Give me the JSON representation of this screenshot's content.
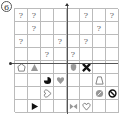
{
  "problem_label": "6",
  "grid": {
    "rows": 8,
    "cols": 8,
    "cells": [
      [
        "?",
        "?",
        "",
        "",
        "",
        "?",
        "",
        "?"
      ],
      [
        "",
        "?",
        "",
        "",
        "",
        "",
        "?",
        ""
      ],
      [
        "?",
        "",
        "",
        "?",
        "",
        "?",
        "",
        ""
      ],
      [
        "",
        "",
        "?",
        "",
        "?",
        "",
        "",
        ""
      ],
      [
        "pentagon-outline",
        "triangle-gray",
        "",
        "",
        "shield-gray",
        "x-black",
        "",
        ""
      ],
      [
        "",
        "",
        "pacman-black",
        "heart-gray",
        "",
        "",
        "trapezoid-outline",
        ""
      ],
      [
        "",
        "",
        "heart-sideways-outline",
        "",
        "",
        "",
        "circle-slash-gray",
        "no-symbol-black"
      ],
      [
        "",
        "triangle-right-black",
        "",
        "",
        "bowtie-gray",
        "heart-outline",
        "",
        ""
      ]
    ]
  },
  "axes": {
    "vertical_axis_column_boundary": 4,
    "horizontal_axis_row_boundary": 4
  },
  "colors": {
    "grid_line": "#bbbbbb",
    "question_mark": "#666666",
    "black_shape": "#111111",
    "gray_shape": "#999999",
    "outline_shape": "#777777"
  }
}
